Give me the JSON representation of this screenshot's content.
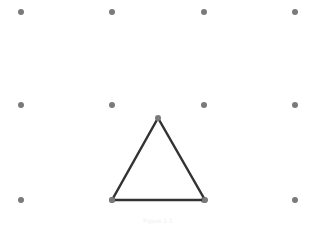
{
  "diagram": {
    "type": "dot-grid-geometry",
    "grid": {
      "columns_x": [
        21,
        112,
        204,
        295
      ],
      "rows_y": [
        12,
        105,
        200
      ],
      "dot_color": "#7a7a7a",
      "dot_radius": 3
    },
    "triangle": {
      "vertices": [
        [
          158,
          118
        ],
        [
          112,
          200
        ],
        [
          205,
          200
        ]
      ],
      "stroke": "#333333",
      "stroke_width": 2.5,
      "vertex_color": "#7a7a7a"
    },
    "caption": "Figure 1.1"
  }
}
